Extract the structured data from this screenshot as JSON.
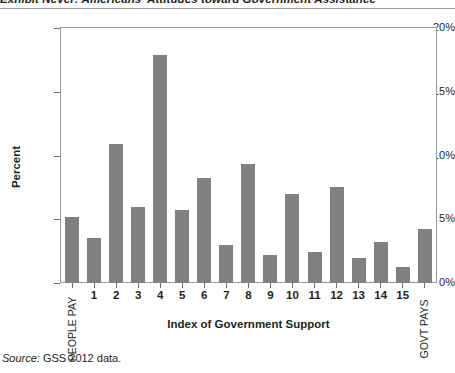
{
  "exhibit": {
    "title": "Exhibit Never: Americans' Attitudes toward Government Assistance",
    "source_word": "Source:",
    "source_text": " GSS 2012 data."
  },
  "colors": {
    "bar": "#808080",
    "frame": "#9a9a9a",
    "text": "#231f20"
  },
  "chart_data": {
    "type": "bar",
    "title": "Exhibit Never: Americans' Attitudes toward Government Assistance",
    "xlabel": "Index of Government Support",
    "ylabel": "Percent",
    "ylim": [
      0,
      20
    ],
    "yticks": [
      0,
      5,
      10,
      15,
      20
    ],
    "ytick_labels": [
      "0%",
      "5%",
      "10%",
      "15%",
      "20%"
    ],
    "grid": false,
    "legend": null,
    "categories": [
      "PEOPLE PAY",
      "1",
      "2",
      "3",
      "4",
      "5",
      "6",
      "7",
      "8",
      "9",
      "10",
      "11",
      "12",
      "13",
      "14",
      "15",
      "GOVT PAYS"
    ],
    "values": [
      5.2,
      3.5,
      10.9,
      6.0,
      17.9,
      5.7,
      8.2,
      3.0,
      9.3,
      2.2,
      7.0,
      2.45,
      7.5,
      2.0,
      3.2,
      1.25,
      4.2
    ],
    "endpoint_labels": {
      "left": "PEOPLE PAY",
      "right": "GOVT PAYS"
    }
  }
}
